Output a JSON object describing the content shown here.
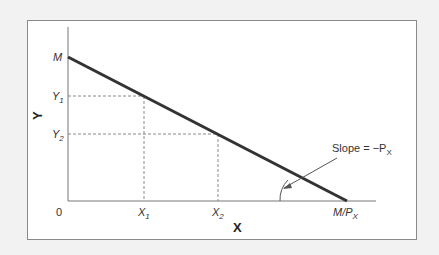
{
  "diagram": {
    "type": "budget-line",
    "y_axis_label": "Y",
    "x_axis_label": "X",
    "origin_label": "0",
    "y_intercept_label": "M",
    "x_intercept_label": "M/P",
    "x_intercept_sub": "X",
    "y_ticks": [
      {
        "base": "Y",
        "sub": "1"
      },
      {
        "base": "Y",
        "sub": "2"
      }
    ],
    "x_ticks": [
      {
        "base": "X",
        "sub": "1"
      },
      {
        "base": "X",
        "sub": "2"
      }
    ],
    "annotation": {
      "text": "Slope = −P",
      "sub": "X"
    },
    "colors": {
      "line": "#333333",
      "axis": "#777777",
      "dashed": "#888888",
      "frame": "#8a8a8a"
    }
  }
}
